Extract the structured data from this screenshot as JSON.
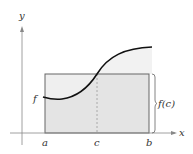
{
  "figure": {
    "type": "mean value theorem for integrals",
    "labels": {
      "y_axis": "y",
      "x_axis": "x",
      "function": "f",
      "a": "a",
      "c": "c",
      "b": "b",
      "height": "f(c)"
    },
    "colors": {
      "axis": "#888888",
      "curve": "#111111",
      "rect_fill": "#e4e4e4",
      "rect_above_curve_fill": "#efefef",
      "under_curve_fill": "#f2f2f2",
      "rect_stroke": "#666666",
      "dashed": "#999999"
    }
  }
}
